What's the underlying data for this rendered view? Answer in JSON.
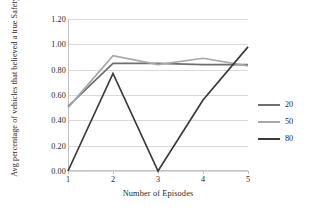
{
  "chart_data": {
    "type": "line",
    "title": "",
    "xlabel": "Number of Episodes",
    "ylabel": "Avg percentage of vehicles that believed a true Safety Event",
    "x": [
      1,
      2,
      3,
      4,
      5
    ],
    "xticklabels": [
      "1",
      "2",
      "3",
      "4",
      "5"
    ],
    "yticklabels": [
      "0.00",
      "0.20",
      "0.40",
      "0.60",
      "0.80",
      "1.00",
      "1.20"
    ],
    "ytickvalues": [
      0.0,
      0.2,
      0.4,
      0.6,
      0.8,
      1.0,
      1.2
    ],
    "ylim": [
      0.0,
      1.2
    ],
    "xlim": [
      1,
      5
    ],
    "grid": "horizontal",
    "legend_position": "right",
    "series": [
      {
        "name": "20",
        "color": "#6e6e6e",
        "values": [
          0.51,
          0.85,
          0.85,
          0.84,
          0.84
        ]
      },
      {
        "name": "50",
        "color": "#a8a8a8",
        "values": [
          0.5,
          0.91,
          0.84,
          0.89,
          0.83
        ]
      },
      {
        "name": "80",
        "color": "#3a3a3a",
        "values": [
          0.0,
          0.77,
          0.0,
          0.56,
          0.98
        ]
      }
    ]
  },
  "legend": {
    "items": [
      {
        "label": "20",
        "color": "#6e6e6e"
      },
      {
        "label": "50",
        "color": "#a8a8a8"
      },
      {
        "label": "80",
        "color": "#3a3a3a"
      }
    ]
  },
  "colors": {
    "gridline": "#d9d9d9",
    "axis": "#bfbfbf",
    "text": "#262626",
    "background": "#ffffff"
  }
}
